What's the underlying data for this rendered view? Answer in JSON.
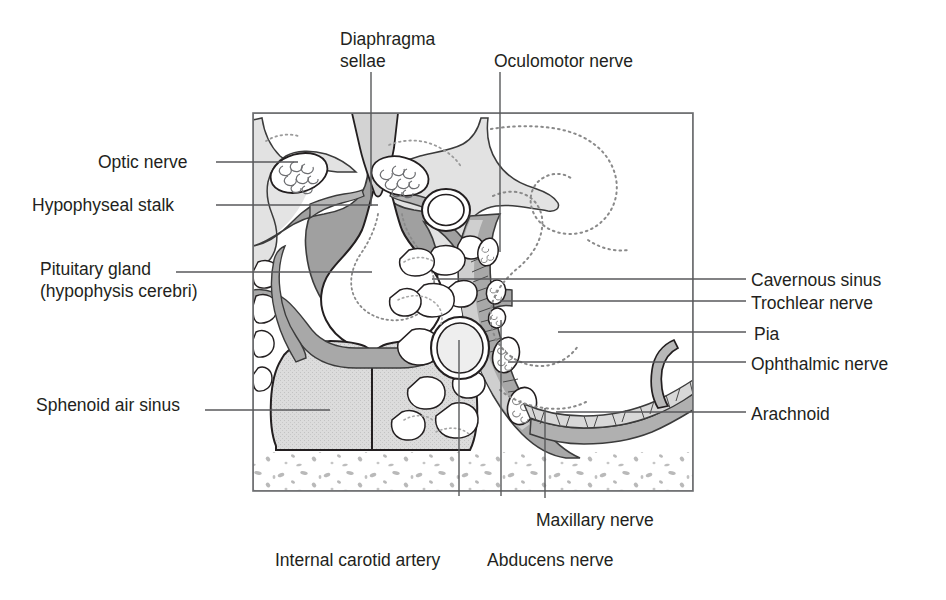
{
  "figure": {
    "type": "anatomical-diagram",
    "colors": {
      "outline": "#231f20",
      "frame": "#6d6e71",
      "leader": "#58595b",
      "dura_mid_gray": "#9a9a9a",
      "bone_light_gray": "#d6d6d6",
      "sinus_fill": "#d4d4d4",
      "arachnoid_fill": "#c9c9c9",
      "cavity_white": "#ffffff",
      "text": "#231f20"
    }
  },
  "labels": {
    "diaphragma_sellae_line1": "Diaphragma",
    "diaphragma_sellae_line2": "sellae",
    "oculomotor_nerve": "Oculomotor nerve",
    "optic_nerve": "Optic nerve",
    "hypophyseal_stalk": "Hypophyseal stalk",
    "pituitary_gland_line1": "Pituitary gland",
    "pituitary_gland_line2": "(hypophysis cerebri)",
    "sphenoid_air_sinus": "Sphenoid air sinus",
    "cavernous_sinus": "Cavernous sinus",
    "trochlear_nerve": "Trochlear nerve",
    "pia": "Pia",
    "ophthalmic_nerve": "Ophthalmic nerve",
    "arachnoid": "Arachnoid",
    "maxillary_nerve": "Maxillary nerve",
    "internal_carotid_artery": "Internal carotid artery",
    "abducens_nerve": "Abducens nerve"
  },
  "label_positions": {
    "diaphragma_sellae": {
      "x": 340,
      "y": 28
    },
    "oculomotor_nerve": {
      "x": 494,
      "y": 51
    },
    "optic_nerve": {
      "x": 98,
      "y": 152
    },
    "hypophyseal_stalk": {
      "x": 32,
      "y": 195
    },
    "pituitary_gland": {
      "x": 40,
      "y": 258
    },
    "sphenoid_air_sinus": {
      "x": 36,
      "y": 395
    },
    "cavernous_sinus": {
      "x": 751,
      "y": 270
    },
    "trochlear_nerve": {
      "x": 751,
      "y": 293
    },
    "pia": {
      "x": 751,
      "y": 324
    },
    "ophthalmic_nerve": {
      "x": 751,
      "y": 354
    },
    "arachnoid": {
      "x": 751,
      "y": 404
    },
    "maxillary_nerve": {
      "x": 536,
      "y": 510
    },
    "internal_carotid_artery": {
      "x": 275,
      "y": 550
    },
    "abducens_nerve": {
      "x": 487,
      "y": 550
    }
  }
}
